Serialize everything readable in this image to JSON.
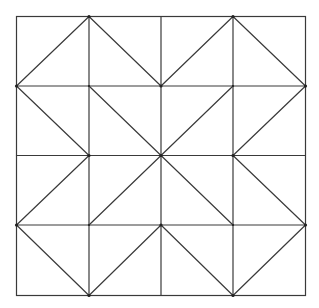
{
  "diagram": {
    "type": "quilt-grid",
    "rows": 4,
    "cols": 4,
    "line_color": "#3a3a3a",
    "background": "#ffffff",
    "cells": [
      [
        "/",
        "\\",
        "/",
        "\\"
      ],
      [
        "\\",
        "\\",
        "/",
        "/"
      ],
      [
        "/",
        "/",
        "\\",
        "\\"
      ],
      [
        "\\",
        "/",
        "\\",
        "/"
      ]
    ]
  }
}
